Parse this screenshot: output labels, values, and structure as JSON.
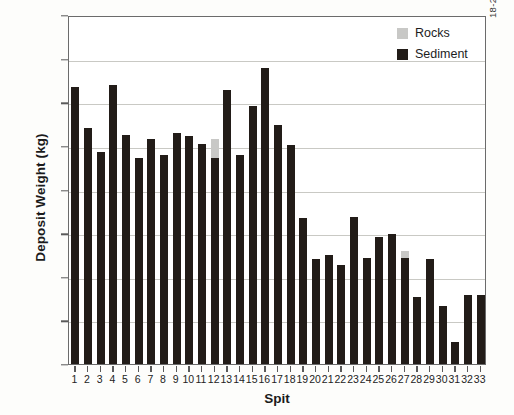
{
  "figure": {
    "side_code": "18-274"
  },
  "legend": {
    "position": "top-right",
    "items": [
      {
        "label": "Rocks",
        "color": "#c8c8c6"
      },
      {
        "label": "Sediment",
        "color": "#221c18"
      }
    ]
  },
  "chart_data": {
    "type": "bar",
    "title": "",
    "subtitle": "",
    "xlabel": "Spit",
    "ylabel": "Deposit Weight (kg)",
    "stacked": true,
    "grid": true,
    "legend_position": "top-right",
    "ylim": [
      0,
      2000
    ],
    "ytick_labels": [
      "2000",
      "1750",
      "1500",
      "1250",
      "750",
      "75",
      "50",
      "25",
      "0"
    ],
    "ytick_values": [
      2000,
      1750,
      1500,
      1250,
      1000,
      750,
      500,
      250,
      0
    ],
    "categories": [
      "1",
      "2",
      "3",
      "4",
      "5",
      "6",
      "7",
      "8",
      "9",
      "10",
      "11",
      "12",
      "13",
      "14",
      "15",
      "16",
      "17",
      "18",
      "19",
      "20",
      "21",
      "22",
      "23",
      "24",
      "25",
      "26",
      "27",
      "28",
      "29",
      "30",
      "31",
      "32",
      "33"
    ],
    "series": [
      {
        "name": "Sediment",
        "color": "#221c18",
        "values": [
          1590,
          1355,
          1215,
          1600,
          1310,
          1180,
          1290,
          1195,
          1325,
          1305,
          1260,
          1180,
          1570,
          1200,
          1480,
          1695,
          1370,
          1255,
          835,
          600,
          625,
          570,
          845,
          610,
          730,
          745,
          610,
          385,
          600,
          330,
          125,
          395,
          395
        ]
      },
      {
        "name": "Rocks",
        "color": "#c8c8c6",
        "values": [
          0,
          0,
          0,
          0,
          0,
          0,
          0,
          0,
          0,
          0,
          0,
          110,
          0,
          0,
          0,
          0,
          0,
          0,
          0,
          0,
          0,
          0,
          0,
          0,
          0,
          0,
          35,
          0,
          0,
          0,
          0,
          0,
          0
        ]
      }
    ]
  }
}
